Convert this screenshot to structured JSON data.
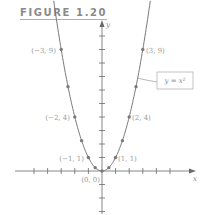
{
  "figure": {
    "title": "FIGURE 1.20",
    "equation_label": "y = x²",
    "x_axis_label": "x",
    "y_axis_label": "y"
  },
  "colors": {
    "curve": "#7a7a7a",
    "axis": "#6a6a6a",
    "point": "#7a7a7a",
    "text": "#9a9a9a",
    "box": "#b5b5b5"
  },
  "chart_data": {
    "type": "line",
    "title": "FIGURE 1.20",
    "function": "y = x^2",
    "xlabel": "x",
    "ylabel": "y",
    "xlim": [
      -6,
      7
    ],
    "ylim": [
      -3,
      11
    ],
    "grid": false,
    "x_ticks": [
      -5,
      -4,
      -3,
      -2,
      -1,
      1,
      2,
      3,
      4,
      5
    ],
    "y_ticks": [
      -3,
      -2,
      -1,
      1,
      2,
      3,
      4,
      5,
      6,
      7,
      8,
      9,
      10
    ],
    "points": [
      {
        "x": -3,
        "y": 9,
        "label": "(−3, 9)"
      },
      {
        "x": -2.5,
        "y": 6.25,
        "label": ""
      },
      {
        "x": -2,
        "y": 4,
        "label": "(−2, 4)"
      },
      {
        "x": -1.5,
        "y": 2.25,
        "label": ""
      },
      {
        "x": -1,
        "y": 1,
        "label": "(−1, 1)"
      },
      {
        "x": -0.5,
        "y": 0.25,
        "label": ""
      },
      {
        "x": 0,
        "y": 0,
        "label": "(0, 0)"
      },
      {
        "x": 0.5,
        "y": 0.25,
        "label": ""
      },
      {
        "x": 1,
        "y": 1,
        "label": "(1, 1)"
      },
      {
        "x": 1.5,
        "y": 2.25,
        "label": ""
      },
      {
        "x": 2,
        "y": 4,
        "label": "(2, 4)"
      },
      {
        "x": 2.5,
        "y": 6.25,
        "label": ""
      },
      {
        "x": 3,
        "y": 9,
        "label": "(3, 9)"
      }
    ],
    "annotations": [
      {
        "text": "y = x²",
        "type": "boxed-callout",
        "points_to": "curve near (2.5, 6.25)"
      }
    ]
  },
  "labels": {
    "p_m3": "(−3, 9)",
    "p_3": "(3, 9)",
    "p_m2": "(−2, 4)",
    "p_2": "(2, 4)",
    "p_m1": "(−1, 1)",
    "p_1": "(1, 1)",
    "p_0": "(0, 0)"
  }
}
